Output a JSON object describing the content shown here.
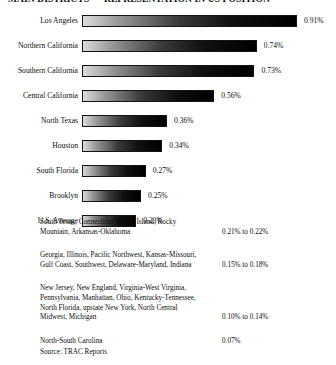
{
  "title": "MAIN DISTRICTS — REPRESENTATION IN US POSITION",
  "source": "Source: TRAC Reports",
  "chart_data": {
    "type": "bar",
    "title": "MAIN DISTRICTS — REPRESENTATION IN US POSITION",
    "orientation": "horizontal",
    "xlabel": "",
    "ylabel": "",
    "unit": "%",
    "grid": false,
    "legend": false,
    "xlim": [
      0,
      0.91
    ],
    "categories": [
      "Los Angeles",
      "Northern California",
      "Southern California",
      "Central California",
      "North Texas",
      "Houston",
      "South Florida",
      "Brooklyn",
      "U.S. Average"
    ],
    "values": [
      0.91,
      0.74,
      0.73,
      0.56,
      0.36,
      0.34,
      0.27,
      0.25,
      0.23
    ],
    "value_labels": [
      "0.91%",
      "0.74%",
      "0.73%",
      "0.56%",
      "0.36%",
      "0.34%",
      "0.27%",
      "0.25%",
      "0.23%"
    ],
    "ranged_groups": [
      {
        "names": [
          "South Texas, Connecticut-Rhode Island, Rocky",
          "Mountain, Arkansas-Oklahoma"
        ],
        "value": "0.21% to 0.22%"
      },
      {
        "names": [
          "Georgia, Illinois, Pacific Northwest, Kansas-Missouri,",
          "Gulf Coast, Southwest, Delaware-Maryland, Indiana"
        ],
        "value": "0.15% to 0.18%"
      },
      {
        "names": [
          "New Jersey, New England, Virginia-West Virginia,",
          "Pennsylvania, Manhattan, Ohio, Kentucky-Tennessee,",
          "North Florida, upstate New York, North Central",
          "Midwest, Michigan"
        ],
        "value": "0.10% to 0.14%"
      },
      {
        "names": [
          "North-South Carolina"
        ],
        "value": "0.07%"
      }
    ],
    "colors": {
      "bar_gradient_start": "#dcdcdc",
      "bar_gradient_end": "#000000",
      "bar_border": "#141414",
      "text": "#0d0d0d",
      "background": "#ffffff"
    }
  }
}
